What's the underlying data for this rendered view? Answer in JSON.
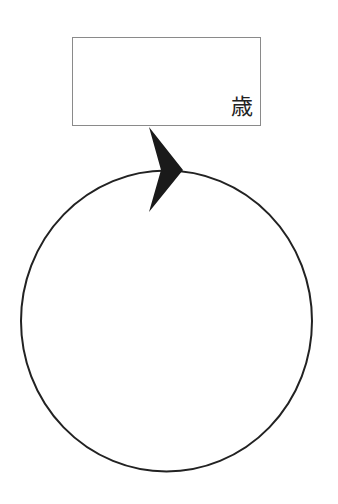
{
  "label_box": {
    "text": "歳"
  },
  "diagram": {
    "shape": "circle",
    "direction": "clockwise",
    "arrow": "arrowhead-at-top",
    "colors": {
      "stroke": "#222222",
      "arrow_fill": "#1a1a1a",
      "box_border": "#8a8a8a"
    }
  }
}
